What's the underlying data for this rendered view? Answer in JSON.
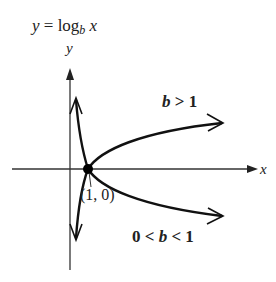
{
  "title": {
    "lhs": "y",
    "eq": " = log",
    "sub": "b",
    "rhs": " x"
  },
  "axes": {
    "x_label": "x",
    "y_label": "y"
  },
  "point": {
    "label": "(1, 0)",
    "x": 1,
    "y": 0
  },
  "curves": [
    {
      "name": "b > 1",
      "label_pre": "",
      "label_var": "b",
      "label_post": " > 1"
    },
    {
      "name": "0 < b < 1",
      "label_pre": "0 < ",
      "label_var": "b",
      "label_post": " < 1"
    }
  ],
  "colors": {
    "stroke": "#111111",
    "background": "#ffffff"
  }
}
